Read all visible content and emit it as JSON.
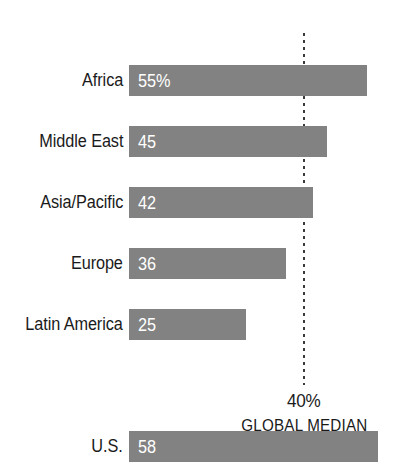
{
  "chart_data": {
    "type": "bar",
    "orientation": "horizontal",
    "title": "",
    "subtitle": "",
    "xlabel": "",
    "ylabel": "",
    "xlim": [
      0,
      64
    ],
    "grid": false,
    "legend": null,
    "categories": [
      "Africa",
      "Middle East",
      "Asia/Pacific",
      "Europe",
      "Latin America",
      "U.S."
    ],
    "values": [
      55,
      45,
      42,
      36,
      25,
      58
    ],
    "value_labels": [
      "55%",
      "45",
      "42",
      "36",
      "25",
      "58"
    ],
    "units": "percent",
    "bars": [
      {
        "category": "Africa",
        "value": 55,
        "label": "55%",
        "bar_px": 238
      },
      {
        "category": "Middle East",
        "value": 45,
        "label": "45",
        "bar_px": 198
      },
      {
        "category": "Asia/Pacific",
        "value": 42,
        "label": "42",
        "bar_px": 184
      },
      {
        "category": "Europe",
        "value": 36,
        "label": "36",
        "bar_px": 157
      },
      {
        "category": "Latin America",
        "value": 25,
        "label": "25",
        "bar_px": 117
      },
      {
        "category": "U.S.",
        "value": 58,
        "label": "58",
        "bar_px": 249
      }
    ],
    "annotations": [
      {
        "name": "global-median",
        "value": 40,
        "value_label": "40%",
        "title": "GLOBAL MEDIAN",
        "style": "dotted-vertical-line"
      }
    ],
    "colors": {
      "bar": "#828282",
      "bar_value_text": "#ffffff",
      "category_label_text": "#1a1a1a",
      "median_line": "#3a3a3a",
      "background": "#ffffff"
    }
  }
}
